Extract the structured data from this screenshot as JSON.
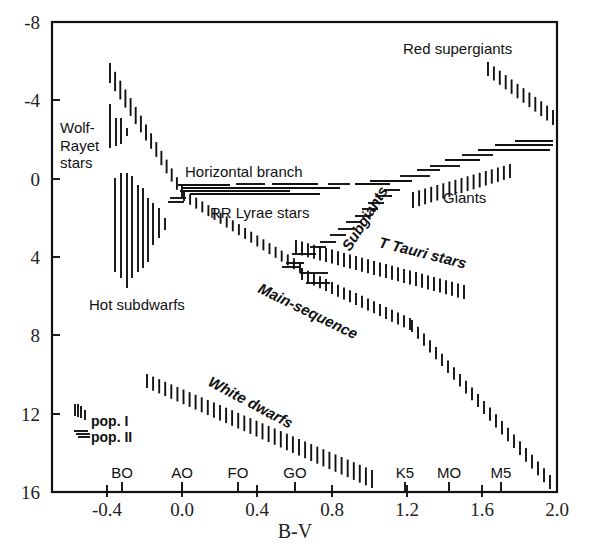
{
  "chart_data": {
    "type": "scatter",
    "title": "",
    "xlabel": "B-V",
    "ylabel": "",
    "xlim": [
      -0.74,
      2.0
    ],
    "ylim": [
      16,
      -8
    ],
    "grid": false,
    "x_ticks": [
      "-0.4",
      "0.0",
      "0.4",
      "0.8",
      "1.2",
      "1.6",
      "2.0"
    ],
    "y_ticks": [
      "-8",
      "-4",
      "0",
      "4",
      "8",
      "12",
      "16"
    ],
    "spectral_types": [
      {
        "label": "BO",
        "bv": -0.32
      },
      {
        "label": "AO",
        "bv": 0.0
      },
      {
        "label": "FO",
        "bv": 0.3
      },
      {
        "label": "GO",
        "bv": 0.6
      },
      {
        "label": "K5",
        "bv": 1.19
      },
      {
        "label": "MO",
        "bv": 1.42
      },
      {
        "label": "M5",
        "bv": 1.7
      }
    ],
    "regions": [
      {
        "name": "Wolf-Rayet stars",
        "population": "I",
        "bv_range": [
          -0.38,
          -0.28
        ],
        "mv_range": [
          -3.6,
          1.5
        ]
      },
      {
        "name": "Upper main-sequence",
        "population": "I",
        "bv_range": [
          -0.38,
          0.05
        ],
        "mv_range": [
          -6.2,
          1.0
        ]
      },
      {
        "name": "Hot subdwarfs",
        "population": "I",
        "bv_range": [
          -0.4,
          -0.05
        ],
        "mv_range": [
          0.0,
          5.5
        ]
      },
      {
        "name": "Horizontal branch",
        "population": "II",
        "bv_range": [
          0.0,
          0.85
        ],
        "mv_range": [
          0.3,
          1.0
        ]
      },
      {
        "name": "RR Lyrae stars",
        "population": "II",
        "bv_range": [
          0.2,
          0.4
        ],
        "mv_range": [
          0.4,
          0.9
        ]
      },
      {
        "name": "Main-sequence",
        "population": "I",
        "bv_range": [
          -0.2,
          1.95
        ],
        "mv_range": [
          0.5,
          16.0
        ]
      },
      {
        "name": "T Tauri stars",
        "population": "I",
        "bv_range": [
          0.6,
          1.45
        ],
        "mv_range": [
          3.5,
          6.0
        ]
      },
      {
        "name": "Subgiants",
        "population": "II",
        "bv_range": [
          0.65,
          1.2
        ],
        "mv_range": [
          0.0,
          3.8
        ]
      },
      {
        "name": "Giants",
        "population": "I",
        "bv_range": [
          0.9,
          1.55
        ],
        "mv_range": [
          -1.0,
          1.2
        ]
      },
      {
        "name": "Giants (pop. II branch)",
        "population": "II",
        "bv_range": [
          0.9,
          1.95
        ],
        "mv_range": [
          -2.0,
          0.8
        ]
      },
      {
        "name": "Red supergiants",
        "population": "I",
        "bv_range": [
          1.6,
          1.95
        ],
        "mv_range": [
          -6.0,
          -2.8
        ]
      },
      {
        "name": "White dwarfs",
        "population": "I",
        "bv_range": [
          -0.2,
          0.95
        ],
        "mv_range": [
          10.0,
          16.0
        ]
      }
    ],
    "legend": [
      {
        "label": "pop. I",
        "marker": "vertical hatching"
      },
      {
        "label": "pop. II",
        "marker": "horizontal hatching"
      }
    ]
  },
  "axis": {
    "x_title": "B-V",
    "x_ticks": [
      {
        "label": "-0.4",
        "x": 107
      },
      {
        "label": "0.0",
        "x": 182
      },
      {
        "label": "0.4",
        "x": 257
      },
      {
        "label": "0.8",
        "x": 332
      },
      {
        "label": "1.2",
        "x": 407
      },
      {
        "label": "1.6",
        "x": 482
      },
      {
        "label": "2.0",
        "x": 557
      }
    ],
    "y_ticks": [
      {
        "label": "-8",
        "y": 22
      },
      {
        "label": "-4",
        "y": 100
      },
      {
        "label": "0",
        "y": 179
      },
      {
        "label": "4",
        "y": 257
      },
      {
        "label": "8",
        "y": 335
      },
      {
        "label": "12",
        "y": 414
      },
      {
        "label": "16",
        "y": 492
      }
    ],
    "spectral": [
      {
        "label": "BO",
        "x": 122
      },
      {
        "label": "AO",
        "x": 182
      },
      {
        "label": "FO",
        "x": 238
      },
      {
        "label": "GO",
        "x": 295
      },
      {
        "label": "K5",
        "x": 405
      },
      {
        "label": "MO",
        "x": 449
      },
      {
        "label": "M5",
        "x": 501
      }
    ]
  },
  "labels": {
    "wolf_rayet_1": "Wolf-",
    "wolf_rayet_2": "Rayet",
    "wolf_rayet_3": "stars",
    "red_supergiants": "Red supergiants",
    "horizontal_branch": "Horizontal branch",
    "rr_lyrae": "RR Lyrae stars",
    "subgiants": "Subgiants",
    "giants": "Giants",
    "t_tauri": "T Tauri stars",
    "hot_subdwarfs": "Hot subdwarfs",
    "main_sequence": "Main-sequence",
    "white_dwarfs": "White dwarfs",
    "pop1": "pop. I",
    "pop2": "pop. II"
  },
  "colors": {
    "ink": "#111111",
    "background": "#ffffff"
  },
  "bands": {
    "vertical": [
      {
        "name": "upper-main-sequence",
        "x1": 110,
        "x2": 182,
        "top1": 63,
        "top2": 186,
        "h1": 20,
        "h2": 12,
        "step": 5
      },
      {
        "name": "main-sequence-mid",
        "x1": 184,
        "x2": 300,
        "top1": 190,
        "top2": 262,
        "h1": 11,
        "h2": 11,
        "step": 6
      },
      {
        "name": "main-sequence-lower",
        "x1": 302,
        "x2": 410,
        "top1": 268,
        "top2": 318,
        "h1": 12,
        "h2": 12,
        "step": 6
      },
      {
        "name": "main-sequence-red",
        "x1": 412,
        "x2": 550,
        "top1": 320,
        "top2": 475,
        "h1": 12,
        "h2": 14,
        "step": 6
      },
      {
        "name": "t-tauri",
        "x1": 296,
        "x2": 464,
        "top1": 240,
        "top2": 285,
        "h1": 14,
        "h2": 14,
        "step": 6
      },
      {
        "name": "giants-pop1",
        "x1": 413,
        "x2": 510,
        "top1": 192,
        "top2": 164,
        "h1": 16,
        "h2": 14,
        "step": 6
      },
      {
        "name": "red-supergiants",
        "x1": 488,
        "x2": 553,
        "top1": 62,
        "top2": 110,
        "h1": 14,
        "h2": 15,
        "step": 5.5
      },
      {
        "name": "white-dwarfs",
        "x1": 147,
        "x2": 372,
        "top1": 374,
        "top2": 470,
        "h1": 14,
        "h2": 18,
        "step": 6
      },
      {
        "name": "wolf-rayet-a",
        "x1": 110,
        "x2": 110,
        "top1": 104,
        "top2": 104,
        "h1": 44,
        "h2": 44,
        "step": 10
      },
      {
        "name": "wolf-rayet-b",
        "x1": 116,
        "x2": 116,
        "top1": 118,
        "top2": 118,
        "h1": 28,
        "h2": 28,
        "step": 10
      },
      {
        "name": "wolf-rayet-c",
        "x1": 121,
        "x2": 121,
        "top1": 118,
        "top2": 118,
        "h1": 26,
        "h2": 26,
        "step": 10
      },
      {
        "name": "wolf-rayet-d",
        "x1": 127,
        "x2": 127,
        "top1": 128,
        "top2": 128,
        "h1": 8,
        "h2": 8,
        "step": 10
      }
    ],
    "subdwarfs": [
      {
        "x": 115,
        "top": 178,
        "bottom": 272
      },
      {
        "x": 121,
        "top": 173,
        "bottom": 278
      },
      {
        "x": 127,
        "top": 173,
        "bottom": 288
      },
      {
        "x": 132,
        "top": 176,
        "bottom": 278
      },
      {
        "x": 138,
        "top": 185,
        "bottom": 272
      },
      {
        "x": 143,
        "top": 188,
        "bottom": 268
      },
      {
        "x": 148,
        "top": 198,
        "bottom": 262
      },
      {
        "x": 153,
        "top": 203,
        "bottom": 245
      },
      {
        "x": 159,
        "top": 208,
        "bottom": 238
      },
      {
        "x": 165,
        "top": 218,
        "bottom": 230
      }
    ],
    "horizontal": [
      {
        "x1": 178,
        "x2": 230,
        "y": 185
      },
      {
        "x1": 236,
        "x2": 265,
        "y": 184
      },
      {
        "x1": 272,
        "x2": 318,
        "y": 184
      },
      {
        "x1": 328,
        "x2": 350,
        "y": 184
      },
      {
        "x1": 182,
        "x2": 340,
        "y": 188
      },
      {
        "x1": 236,
        "x2": 262,
        "y": 188
      },
      {
        "x1": 180,
        "x2": 290,
        "y": 191
      },
      {
        "x1": 236,
        "x2": 262,
        "y": 191
      },
      {
        "x1": 190,
        "x2": 320,
        "y": 194
      },
      {
        "x1": 170,
        "x2": 186,
        "y": 198
      },
      {
        "x1": 168,
        "x2": 184,
        "y": 202
      },
      {
        "x1": 355,
        "x2": 390,
        "y": 184
      },
      {
        "x1": 370,
        "x2": 412,
        "y": 181
      },
      {
        "x1": 400,
        "x2": 430,
        "y": 176
      },
      {
        "x1": 417,
        "x2": 440,
        "y": 170
      },
      {
        "x1": 430,
        "x2": 460,
        "y": 166
      },
      {
        "x1": 445,
        "x2": 480,
        "y": 160
      },
      {
        "x1": 462,
        "x2": 493,
        "y": 155
      },
      {
        "x1": 478,
        "x2": 550,
        "y": 150
      },
      {
        "x1": 495,
        "x2": 553,
        "y": 145
      },
      {
        "x1": 515,
        "x2": 553,
        "y": 141
      },
      {
        "x1": 384,
        "x2": 400,
        "y": 190
      },
      {
        "x1": 376,
        "x2": 392,
        "y": 196
      },
      {
        "x1": 368,
        "x2": 384,
        "y": 203
      },
      {
        "x1": 362,
        "x2": 378,
        "y": 209
      },
      {
        "x1": 355,
        "x2": 371,
        "y": 216
      },
      {
        "x1": 346,
        "x2": 362,
        "y": 222
      },
      {
        "x1": 338,
        "x2": 354,
        "y": 229
      },
      {
        "x1": 330,
        "x2": 346,
        "y": 235
      },
      {
        "x1": 320,
        "x2": 336,
        "y": 242
      },
      {
        "x1": 310,
        "x2": 326,
        "y": 247
      },
      {
        "x1": 292,
        "x2": 316,
        "y": 254
      },
      {
        "x1": 286,
        "x2": 304,
        "y": 263
      },
      {
        "x1": 282,
        "x2": 300,
        "y": 267
      },
      {
        "x1": 300,
        "x2": 328,
        "y": 273
      },
      {
        "x1": 306,
        "x2": 330,
        "y": 283
      }
    ],
    "legend_pop1": [
      {
        "x": 75,
        "top": 404,
        "bottom": 416
      },
      {
        "x": 78,
        "top": 404,
        "bottom": 417
      },
      {
        "x": 81,
        "top": 406,
        "bottom": 418
      },
      {
        "x": 85,
        "top": 410,
        "bottom": 420
      }
    ],
    "legend_pop2": [
      {
        "x1": 74,
        "x2": 88,
        "y": 431
      },
      {
        "x1": 76,
        "x2": 90,
        "y": 434
      },
      {
        "x1": 78,
        "x2": 90,
        "y": 437
      }
    ]
  }
}
